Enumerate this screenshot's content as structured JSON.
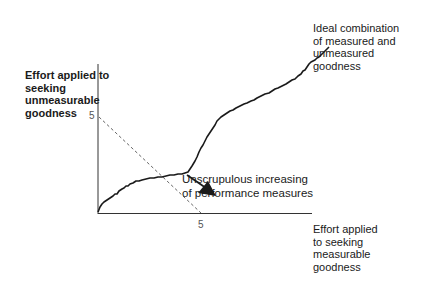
{
  "diagram": {
    "y_axis_label": [
      "Effort applied to",
      "seeking",
      "unmeasurable",
      "goodness"
    ],
    "x_axis_label": [
      "Effort applied",
      "to seeking",
      "measurable",
      "goodness"
    ],
    "y_tick": "5",
    "x_tick": "5",
    "curve_end_label": [
      "Ideal combination",
      "of measured and",
      "unmeasured",
      "goodness"
    ],
    "arrow_label": [
      "Unscrupulous increasing",
      "of performance measures"
    ],
    "colors": {
      "line": "#1a1a1a",
      "dashed": "#555555",
      "text": "#1a1a1a",
      "tick": "#555555"
    }
  }
}
